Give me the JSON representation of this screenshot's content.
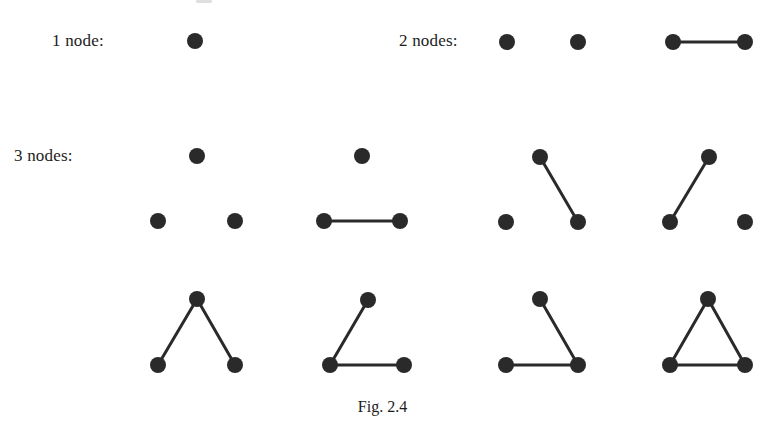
{
  "figure": {
    "caption": "Fig. 2.4",
    "background_color": "#ffffff",
    "ink_color": "#2a2a2a",
    "node_radius": 8,
    "edge_width": 3
  },
  "row_labels": {
    "one_node": "1 node:",
    "two_nodes": "2 nodes:",
    "three_nodes": "3 nodes:"
  },
  "chart_data": {
    "type": "diagram",
    "title": "Fig. 2.4",
    "node_radius": 8,
    "edge_width": 3,
    "node_color": "#2a2a2a",
    "edge_color": "#2a2a2a",
    "graphs": [
      {
        "id": "g1-n1",
        "label_group": "1 node:",
        "node_count": 1,
        "edge_count": 0,
        "nodes": [
          {
            "id": "a",
            "x": 195,
            "y": 41
          }
        ],
        "edges": []
      },
      {
        "id": "g2-n2-empty",
        "label_group": "2 nodes:",
        "node_count": 2,
        "edge_count": 0,
        "nodes": [
          {
            "id": "a",
            "x": 507,
            "y": 42
          },
          {
            "id": "b",
            "x": 578,
            "y": 42
          }
        ],
        "edges": []
      },
      {
        "id": "g3-n2-edge",
        "label_group": "2 nodes:",
        "node_count": 2,
        "edge_count": 1,
        "nodes": [
          {
            "id": "a",
            "x": 673,
            "y": 42
          },
          {
            "id": "b",
            "x": 745,
            "y": 42
          }
        ],
        "edges": [
          {
            "from": "a",
            "to": "b"
          }
        ]
      },
      {
        "id": "g4-n3-empty",
        "label_group": "3 nodes:",
        "node_count": 3,
        "edge_count": 0,
        "nodes": [
          {
            "id": "t",
            "x": 197,
            "y": 156
          },
          {
            "id": "l",
            "x": 158,
            "y": 221
          },
          {
            "id": "r",
            "x": 235,
            "y": 221
          }
        ],
        "edges": []
      },
      {
        "id": "g5-n3-base-edge",
        "label_group": "3 nodes:",
        "node_count": 3,
        "edge_count": 1,
        "nodes": [
          {
            "id": "t",
            "x": 362,
            "y": 156
          },
          {
            "id": "l",
            "x": 324,
            "y": 221
          },
          {
            "id": "r",
            "x": 400,
            "y": 221
          }
        ],
        "edges": [
          {
            "from": "l",
            "to": "r"
          }
        ]
      },
      {
        "id": "g6-n3-right-edge",
        "label_group": "3 nodes:",
        "node_count": 3,
        "edge_count": 1,
        "nodes": [
          {
            "id": "t",
            "x": 540,
            "y": 157
          },
          {
            "id": "l",
            "x": 506,
            "y": 222
          },
          {
            "id": "r",
            "x": 578,
            "y": 222
          }
        ],
        "edges": [
          {
            "from": "t",
            "to": "r"
          }
        ]
      },
      {
        "id": "g7-n3-left-edge",
        "label_group": "3 nodes:",
        "node_count": 3,
        "edge_count": 1,
        "nodes": [
          {
            "id": "t",
            "x": 709,
            "y": 157
          },
          {
            "id": "l",
            "x": 670,
            "y": 222
          },
          {
            "id": "r",
            "x": 745,
            "y": 222
          }
        ],
        "edges": [
          {
            "from": "t",
            "to": "l"
          }
        ]
      },
      {
        "id": "g8-n3-path-v",
        "label_group": "3 nodes:",
        "node_count": 3,
        "edge_count": 2,
        "nodes": [
          {
            "id": "t",
            "x": 197,
            "y": 299
          },
          {
            "id": "l",
            "x": 158,
            "y": 365
          },
          {
            "id": "r",
            "x": 235,
            "y": 365
          }
        ],
        "edges": [
          {
            "from": "t",
            "to": "l"
          },
          {
            "from": "t",
            "to": "r"
          }
        ]
      },
      {
        "id": "g9-n3-path-left",
        "label_group": "3 nodes:",
        "node_count": 3,
        "edge_count": 2,
        "nodes": [
          {
            "id": "t",
            "x": 368,
            "y": 300
          },
          {
            "id": "l",
            "x": 330,
            "y": 365
          },
          {
            "id": "r",
            "x": 404,
            "y": 365
          }
        ],
        "edges": [
          {
            "from": "t",
            "to": "l"
          },
          {
            "from": "l",
            "to": "r"
          }
        ]
      },
      {
        "id": "g10-n3-path-right",
        "label_group": "3 nodes:",
        "node_count": 3,
        "edge_count": 2,
        "nodes": [
          {
            "id": "t",
            "x": 540,
            "y": 299
          },
          {
            "id": "l",
            "x": 506,
            "y": 365
          },
          {
            "id": "r",
            "x": 578,
            "y": 365
          }
        ],
        "edges": [
          {
            "from": "t",
            "to": "r"
          },
          {
            "from": "l",
            "to": "r"
          }
        ]
      },
      {
        "id": "g11-n3-triangle",
        "label_group": "3 nodes:",
        "node_count": 3,
        "edge_count": 3,
        "nodes": [
          {
            "id": "t",
            "x": 708,
            "y": 299
          },
          {
            "id": "l",
            "x": 670,
            "y": 365
          },
          {
            "id": "r",
            "x": 745,
            "y": 365
          }
        ],
        "edges": [
          {
            "from": "t",
            "to": "l"
          },
          {
            "from": "t",
            "to": "r"
          },
          {
            "from": "l",
            "to": "r"
          }
        ]
      }
    ]
  }
}
